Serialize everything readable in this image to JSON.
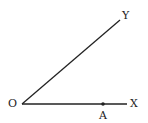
{
  "diagram": {
    "type": "angle",
    "points": {
      "O": {
        "label": "O",
        "x": 22,
        "y": 104
      },
      "X": {
        "label": "X",
        "x": 127,
        "y": 104
      },
      "Y": {
        "label": "Y",
        "x": 120,
        "y": 20
      },
      "A": {
        "label": "A",
        "x": 103,
        "y": 104
      }
    },
    "rays": [
      {
        "from": "O",
        "to": "X"
      },
      {
        "from": "O",
        "to": "Y"
      }
    ],
    "stroke_color": "#222222"
  }
}
